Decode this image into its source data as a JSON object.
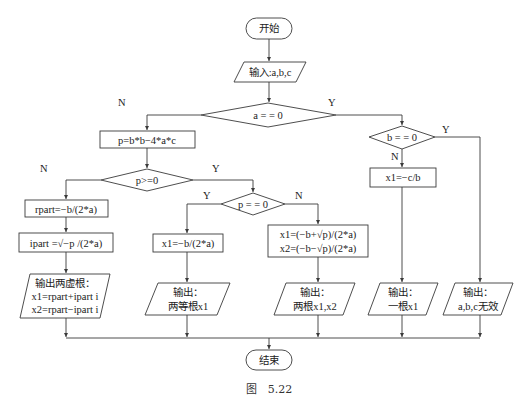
{
  "nodes": {
    "start": "开始",
    "input": "输入:a,b,c",
    "cond_a": "a = = 0",
    "calc_p": "p=b*b−4*a*c",
    "cond_p_ge": "p>=0",
    "rpart": "rpart=−b/(2*a)",
    "ipart": "ipart =√−p /(2*a)",
    "cond_p_eq": "p = = 0",
    "x1_equal": "x1=−b/(2*a)",
    "x1_two": "x1=(−b+√p)/(2*a)",
    "x2_two": "x2=(−b−√p)/(2*a)",
    "cond_b": "b = = 0",
    "x1_linear": "x1=−c/b",
    "out_complex_1": "输出两虚根：",
    "out_complex_2": "x1=rpart+ipart i",
    "out_complex_3": "x2=rpart−ipart i",
    "out_equal_1": "输出：",
    "out_equal_2": "两等根x1",
    "out_two_1": "输出：",
    "out_two_2": "两根x1,x2",
    "out_one_1": "输出：",
    "out_one_2": "一根x1",
    "out_invalid_1": "输出：",
    "out_invalid_2": "a,b,c无效",
    "end": "结束"
  },
  "branch_labels": {
    "a_no": "N",
    "a_yes": "Y",
    "p_ge_no": "N",
    "p_ge_yes": "Y",
    "p_eq_yes": "Y",
    "p_eq_no": "N",
    "b_no": "N",
    "b_yes": "Y"
  },
  "caption": "图　5.22"
}
